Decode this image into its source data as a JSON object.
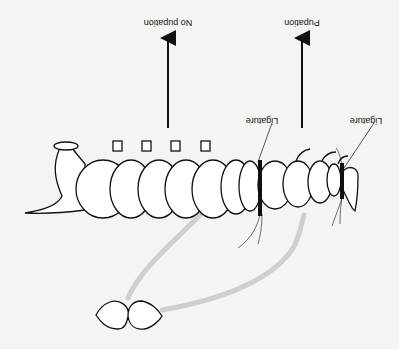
{
  "figure": {
    "orientation": "rotated-180",
    "background": "#f4f4f2",
    "ink": "#111111",
    "pathway_color": "#cfcfcf"
  },
  "labels": {
    "no_pupation": "No pupation",
    "pupation": "Pupation",
    "ligature_1": "Ligature",
    "ligature_2": "Ligature"
  },
  "parts": {
    "larva": "insect larva (segmented body)",
    "brain": "brain / endocrine gland",
    "ligatures": 2,
    "arrows": 2,
    "hormone_pathways": 2
  }
}
